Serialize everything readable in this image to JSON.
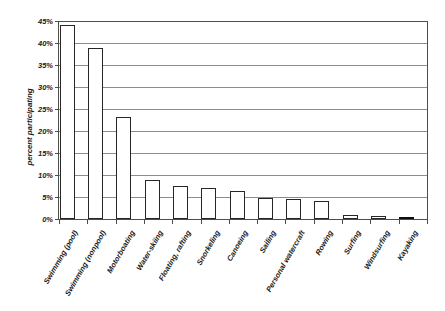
{
  "chart_data": {
    "type": "bar",
    "title": "",
    "xlabel": "",
    "ylabel": "percent participating",
    "ylim": [
      0,
      45
    ],
    "ytick_step": 5,
    "grid": true,
    "legend": "none",
    "yticks": [
      "0%",
      "5%",
      "10%",
      "15%",
      "20%",
      "25%",
      "30%",
      "35%",
      "40%",
      "45%"
    ],
    "ytick_values": [
      0,
      5,
      10,
      15,
      20,
      25,
      30,
      35,
      40,
      45
    ],
    "categories": [
      "Swimming (pool)",
      "Swimming (nonpool)",
      "Motorboating",
      "Water-skiing",
      "Floating, rafting",
      "Snorkeling",
      "Canoeing",
      "Sailing",
      "Personal watercraft",
      "Rowing",
      "Surfing",
      "Windsurfing",
      "Kayaking"
    ],
    "values": [
      44.1,
      38.9,
      23.2,
      8.9,
      7.5,
      7.0,
      6.4,
      4.7,
      4.5,
      4.0,
      0.9,
      0.7,
      0.3
    ],
    "bar_styles": [
      "outline",
      "outline",
      "outline",
      "outline",
      "outline",
      "outline",
      "outline",
      "outline",
      "outline",
      "outline",
      "outline",
      "outline",
      "filled"
    ],
    "colors": {
      "bar_fill": "#ffffff",
      "bar_edge": "#262626",
      "bar_fill_highlight": "#0d0d0d",
      "gridline": "#8c8c8c",
      "axis": "#4d4d4d",
      "text": "#1a1a1a",
      "background": "#ffffff"
    }
  }
}
